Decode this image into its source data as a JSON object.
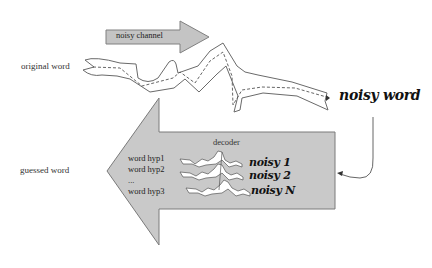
{
  "diagram": {
    "labels": {
      "original_word": "original word",
      "guessed_word": "guessed word",
      "noisy_channel": "noisy channel",
      "noisy_word": "noisy word",
      "decoder": "decoder"
    },
    "hypotheses": [
      "word hyp1",
      "word hyp2",
      "...",
      "word hyp3"
    ],
    "noisy_outputs": [
      "noisy 1",
      "noisy 2",
      "noisy N"
    ],
    "colors": {
      "arrow_fill": "#c8c8c8",
      "arrow_stroke": "#777777",
      "line": "#555555",
      "text": "#333333",
      "script_text": "#111111"
    }
  }
}
